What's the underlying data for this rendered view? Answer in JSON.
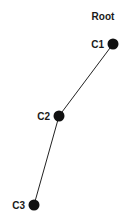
{
  "diagram": {
    "title": "Root",
    "nodes": [
      {
        "id": "C1",
        "label": "C1",
        "x": 113,
        "y": 44,
        "r": 5.5
      },
      {
        "id": "C2",
        "label": "C2",
        "x": 59,
        "y": 116,
        "r": 5.5
      },
      {
        "id": "C3",
        "label": "C3",
        "x": 34,
        "y": 205,
        "r": 5.5
      }
    ],
    "edges": [
      {
        "from": "C1",
        "to": "C2"
      },
      {
        "from": "C2",
        "to": "C3"
      }
    ],
    "colors": {
      "node": "#111111",
      "edge": "#222222",
      "text": "#1a1a1a",
      "background": "#ffffff"
    }
  }
}
